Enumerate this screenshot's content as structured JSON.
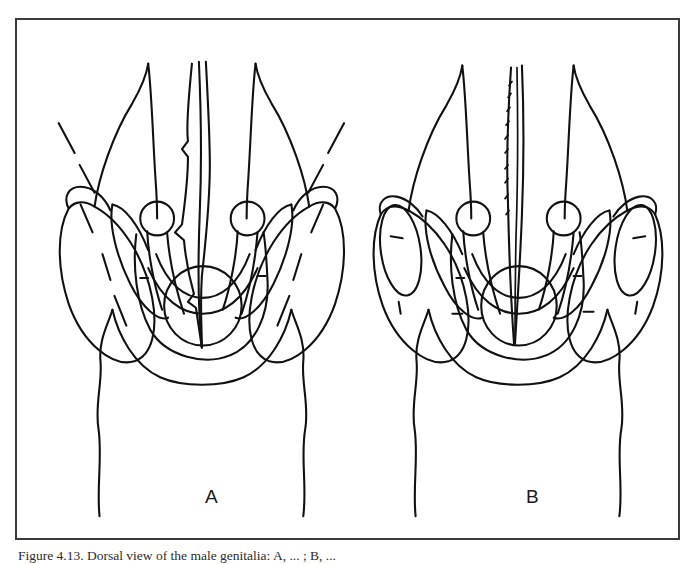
{
  "figure": {
    "frame_border_color": "#3a3a3a",
    "background_color": "#ffffff",
    "ink_color": "#111111",
    "caption": "Figure 4.13. Dorsal view of the male genitalia: A, ... ; B, ...",
    "panels": [
      {
        "id": "A",
        "label": "A",
        "description": "Dorsal view of male genitalia with broad lateral lobes, paired circular basal knobs, elongate jagged median aedeagus and ovate basal plate; dashed shading lines on outer lobes."
      },
      {
        "id": "B",
        "label": "B",
        "description": "Dorsal view of male genitalia with narrower lateral lobes each enclosing an elongate inner ellipse, paired circular basal knobs, slender finely serrate median aedeagus and ovate basal plate."
      }
    ]
  }
}
